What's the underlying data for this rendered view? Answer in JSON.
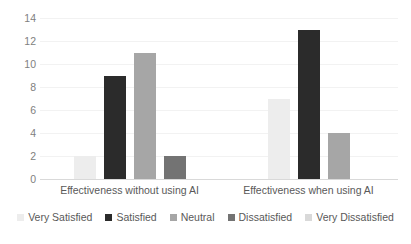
{
  "chart_data": {
    "type": "bar",
    "title": "",
    "subtitle": "",
    "xlabel": "",
    "ylabel": "",
    "ylim": [
      0,
      14
    ],
    "ytick_step": 2,
    "yticks": [
      "14",
      "12",
      "10",
      "8",
      "6",
      "4",
      "2",
      "0"
    ],
    "grid": true,
    "grid_axis": "y",
    "legend_position": "bottom",
    "categories": [
      "Effectiveness without using AI",
      "Effectiveness when using AI"
    ],
    "series": [
      {
        "name": "Very Satisfied",
        "color": "#ededed",
        "values": [
          2,
          7
        ]
      },
      {
        "name": "Satisfied",
        "color": "#2b2b2b",
        "values": [
          9,
          13
        ]
      },
      {
        "name": "Neutral",
        "color": "#a6a6a6",
        "values": [
          11,
          4
        ]
      },
      {
        "name": "Dissatisfied",
        "color": "#737373",
        "values": [
          2,
          0
        ]
      },
      {
        "name": "Very Dissatisfied",
        "color": "#d9d9d9",
        "values": [
          0,
          0
        ]
      }
    ]
  },
  "axis": {
    "y_max_label": "14",
    "y_min_label": "0"
  }
}
